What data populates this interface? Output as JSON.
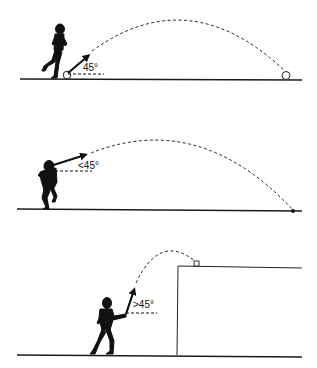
{
  "diagram": {
    "panels": [
      {
        "id": "kick-45",
        "description": "Player kicking ball from ground at 45 degrees",
        "angle_label": "45°",
        "ball": "ball at start and landing point"
      },
      {
        "id": "throw-lt45",
        "description": "Player throwing from shoulder height at less than 45 degrees",
        "angle_label": "<45°",
        "ball": "shot landing point"
      },
      {
        "id": "throw-gt45",
        "description": "Player throwing upward over an elevated platform at greater than 45 degrees",
        "angle_label": ">45°",
        "ball": "ball landing on top of platform"
      }
    ],
    "colors": {
      "ink": "#111111",
      "background": "#ffffff"
    }
  }
}
